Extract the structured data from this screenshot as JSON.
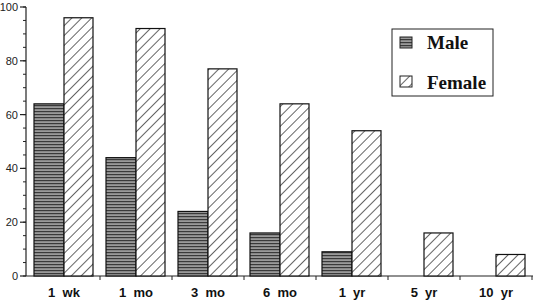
{
  "chart_data": {
    "type": "bar",
    "title": "",
    "xlabel": "",
    "ylabel": "",
    "ylim": [
      0,
      100
    ],
    "yticks": [
      0,
      20,
      40,
      60,
      80,
      100
    ],
    "minor_tick_step": 5,
    "grid": false,
    "legend_position": "upper right",
    "categories": [
      "1  wk",
      "1  mo",
      "3  mo",
      "6  mo",
      "1  yr",
      "5  yr",
      "10  yr"
    ],
    "series": [
      {
        "name": "Male",
        "pattern": "horizontal-lines",
        "values": [
          64,
          44,
          24,
          16,
          9,
          0,
          0
        ]
      },
      {
        "name": "Female",
        "pattern": "diagonal-hatch",
        "values": [
          96,
          92,
          77,
          64,
          54,
          16,
          8
        ]
      }
    ]
  },
  "legend": {
    "items": [
      {
        "label": "Male"
      },
      {
        "label": "Female"
      }
    ]
  },
  "colors": {
    "axis": "#222222",
    "male_fill": "#8a8a8a",
    "female_fill": "#ffffff",
    "outline": "#111111"
  }
}
